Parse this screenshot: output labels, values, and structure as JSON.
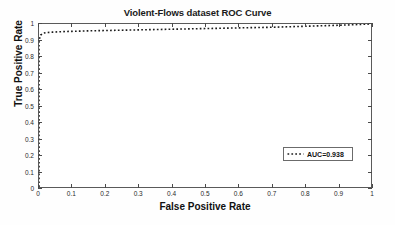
{
  "chart_data": {
    "type": "line",
    "title": "Violent-Flows dataset ROC Curve",
    "xlabel": "False Positive Rate",
    "ylabel": "True Positive Rate",
    "xlim": [
      0,
      1
    ],
    "ylim": [
      0,
      1
    ],
    "grid": false,
    "legend_position": "center-right",
    "xticks": [
      "0",
      "0.1",
      "0.2",
      "0.3",
      "0.4",
      "0.5",
      "0.6",
      "0.7",
      "0.8",
      "0.9",
      "1"
    ],
    "xtick_values": [
      0,
      0.1,
      0.2,
      0.3,
      0.4,
      0.5,
      0.6,
      0.7,
      0.8,
      0.9,
      1
    ],
    "yticks": [
      "0",
      "0.1",
      "0.2",
      "0.3",
      "0.4",
      "0.5",
      "0.6",
      "0.7",
      "0.8",
      "0.9",
      "1"
    ],
    "ytick_values": [
      0,
      0.1,
      0.2,
      0.3,
      0.4,
      0.5,
      0.6,
      0.7,
      0.8,
      0.9,
      1
    ],
    "series": [
      {
        "name": "AUC=0.938",
        "linestyle": "dotted",
        "color": "#1c1c1c",
        "x": [
          0,
          0,
          0.005,
          0.012,
          0.02,
          0.04,
          0.06,
          0.08,
          0.1,
          0.15,
          0.2,
          0.25,
          0.3,
          0.35,
          0.4,
          0.45,
          0.5,
          0.55,
          0.6,
          0.65,
          0.7,
          0.75,
          0.8,
          0.85,
          0.9,
          0.94,
          0.97,
          1.0
        ],
        "y": [
          0,
          0.9,
          0.932,
          0.943,
          0.947,
          0.95,
          0.952,
          0.954,
          0.955,
          0.958,
          0.96,
          0.962,
          0.964,
          0.966,
          0.968,
          0.97,
          0.972,
          0.974,
          0.976,
          0.978,
          0.98,
          0.983,
          0.986,
          0.989,
          0.992,
          0.995,
          0.998,
          1.0
        ]
      }
    ],
    "annotations": [],
    "auc_value": "0.938"
  },
  "legend": {
    "entries": [
      {
        "label": "AUC=0.938"
      }
    ]
  }
}
